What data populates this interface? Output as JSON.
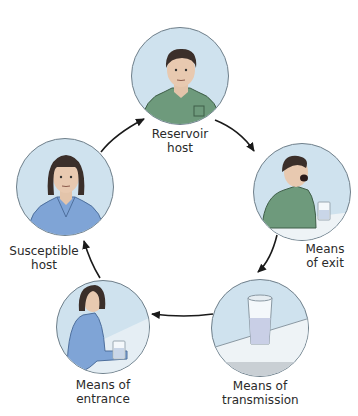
{
  "diagram": {
    "topic": "Chain of infection",
    "nodes": [
      {
        "id": "reservoir-host",
        "label_line1": "Reservoir",
        "label_line2": "host",
        "depicts": "man in green shirt"
      },
      {
        "id": "means-of-exit",
        "label_line1": "Means",
        "label_line2": "of exit",
        "depicts": "man coughing next to glass of water"
      },
      {
        "id": "means-of-transmission",
        "label_line1": "Means of",
        "label_line2": "transmission",
        "depicts": "glass of water on table"
      },
      {
        "id": "means-of-entrance",
        "label_line1": "Means of",
        "label_line2": "entrance",
        "depicts": "woman picking up glass of water"
      },
      {
        "id": "susceptible-host",
        "label_line1": "Susceptible",
        "label_line2": "host",
        "depicts": "woman in blue shirt"
      }
    ],
    "edges": [
      {
        "from": "reservoir-host",
        "to": "means-of-exit"
      },
      {
        "from": "means-of-exit",
        "to": "means-of-transmission"
      },
      {
        "from": "means-of-transmission",
        "to": "means-of-entrance"
      },
      {
        "from": "means-of-entrance",
        "to": "susceptible-host"
      },
      {
        "from": "susceptible-host",
        "to": "reservoir-host"
      }
    ],
    "colors": {
      "circle_fill": "#cfe2ee",
      "circle_border": "#6f7f8a",
      "green_shirt": "#6e9a7c",
      "blue_shirt": "#7fa4d6",
      "hair_dark": "#3b2f2a",
      "skin": "#e8c9b0",
      "arrow": "#1a1a1a"
    }
  }
}
